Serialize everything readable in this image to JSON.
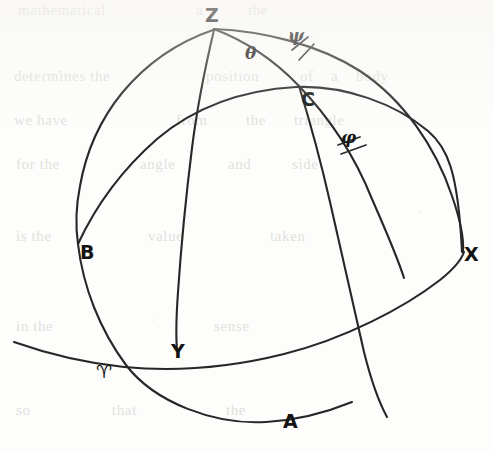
{
  "figure": {
    "background_color": "#fdfdfc",
    "line_color": "#272727",
    "label_color": "#131313",
    "width": 494,
    "height": 451
  },
  "points": [
    {
      "id": "Z",
      "label": "Z",
      "meaning": "zenith",
      "x": 205,
      "y": 6
    },
    {
      "id": "C",
      "label": "C",
      "meaning": "celestial-body",
      "x": 301,
      "y": 90
    },
    {
      "id": "B",
      "label": "B",
      "meaning": "point-b",
      "x": 80,
      "y": 243
    },
    {
      "id": "X",
      "label": "X",
      "meaning": "point-x",
      "x": 464,
      "y": 245
    },
    {
      "id": "Y",
      "label": "Y",
      "meaning": "point-y",
      "x": 171,
      "y": 342
    },
    {
      "id": "A",
      "label": "A",
      "meaning": "point-a",
      "x": 283,
      "y": 412
    },
    {
      "id": "Aries",
      "label": "♈",
      "meaning": "vernal-equinox",
      "x": 96,
      "y": 363
    }
  ],
  "angles": [
    {
      "id": "theta",
      "label": "θ",
      "meaning": "angle-theta",
      "x": 245,
      "y": 45
    },
    {
      "id": "psi",
      "label": "ψ",
      "meaning": "angle-psi",
      "x": 288,
      "y": 27
    },
    {
      "id": "phi",
      "label": "φ",
      "meaning": "angle-phi",
      "x": 341,
      "y": 129
    }
  ],
  "curves": [
    {
      "id": "horizon",
      "meaning": "horizon-great-circle",
      "from": "Z",
      "to": "A"
    },
    {
      "id": "meridian",
      "meaning": "meridian-great-circle",
      "from": "Z",
      "to": "X"
    },
    {
      "id": "equator",
      "meaning": "equator-great-circle",
      "from": "B",
      "to": "X"
    },
    {
      "id": "ecliptic",
      "meaning": "ecliptic-great-circle",
      "from": "Aries",
      "to": "X"
    },
    {
      "id": "vertical-circle",
      "meaning": "vertical-circle-through-C",
      "from": "Z",
      "to": "Y"
    },
    {
      "id": "hour-circle",
      "meaning": "hour-circle-through-C",
      "from": "C",
      "to": "A"
    },
    {
      "id": "outer-limb",
      "meaning": "outer-limb-arc",
      "from": "Z",
      "to": "X"
    }
  ],
  "ticks": [
    {
      "id": "psi-tick",
      "meaning": "right-angle-tick-psi"
    },
    {
      "id": "phi-tick",
      "meaning": "right-angle-tick-phi"
    }
  ],
  "ghost_text": [
    {
      "text": "mathematical",
      "x": 18,
      "y": 2
    },
    {
      "text": "a",
      "x": 196,
      "y": 2
    },
    {
      "text": "the",
      "x": 248,
      "y": 2
    },
    {
      "text": "determines the",
      "x": 14,
      "y": 68
    },
    {
      "text": "position",
      "x": 206,
      "y": 68
    },
    {
      "text": "of",
      "x": 300,
      "y": 68
    },
    {
      "text": "a",
      "x": 331,
      "y": 68
    },
    {
      "text": "body",
      "x": 356,
      "y": 68
    },
    {
      "text": "we have",
      "x": 14,
      "y": 112
    },
    {
      "text": "from",
      "x": 176,
      "y": 112
    },
    {
      "text": "the",
      "x": 246,
      "y": 112
    },
    {
      "text": "triangle",
      "x": 294,
      "y": 112
    },
    {
      "text": "for the",
      "x": 16,
      "y": 156
    },
    {
      "text": "angle",
      "x": 140,
      "y": 156
    },
    {
      "text": "and",
      "x": 228,
      "y": 156
    },
    {
      "text": "side",
      "x": 292,
      "y": 156
    },
    {
      "text": "is the",
      "x": 16,
      "y": 228
    },
    {
      "text": "value",
      "x": 148,
      "y": 228
    },
    {
      "text": "taken",
      "x": 270,
      "y": 228
    },
    {
      "text": "in the",
      "x": 16,
      "y": 318
    },
    {
      "text": "sense",
      "x": 214,
      "y": 318
    },
    {
      "text": "so",
      "x": 16,
      "y": 402
    },
    {
      "text": "that",
      "x": 112,
      "y": 402
    },
    {
      "text": "the",
      "x": 226,
      "y": 402
    }
  ]
}
